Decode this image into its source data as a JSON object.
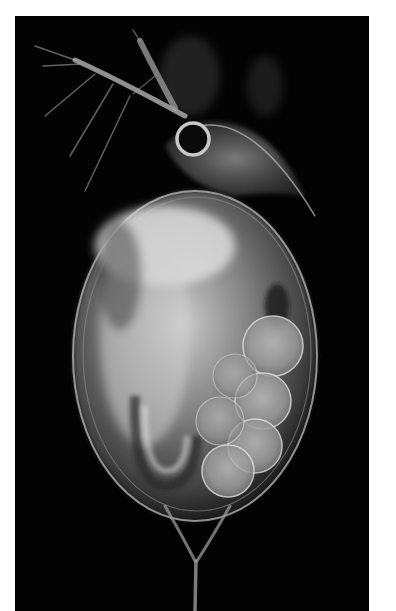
{
  "image": {
    "subject": "daphnia micrograph",
    "background_color": "#030303",
    "border_color": "#ffffff",
    "photo_box": {
      "left": 15,
      "top": 16,
      "width": 354,
      "height": 595
    }
  },
  "colors": {
    "carapace": "#8a8a8a",
    "carapace_highlight": "#d8d8d8",
    "egg": "#b0b0b0",
    "egg_outline": "#e0e0e0",
    "antenna": "#a8a8a8",
    "dark_gut": "#2a2a2a"
  }
}
